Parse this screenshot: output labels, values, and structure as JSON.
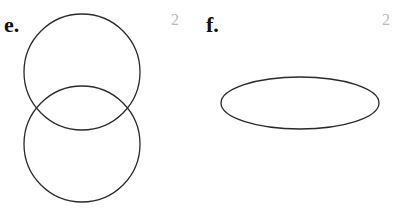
{
  "problems": [
    {
      "label": "e.",
      "marks": "2",
      "shapes": [
        {
          "type": "circle",
          "cx": 82,
          "cy": 72,
          "r": 58
        },
        {
          "type": "circle",
          "cx": 82,
          "cy": 144,
          "r": 58
        }
      ]
    },
    {
      "label": "f.",
      "marks": "2",
      "shapes": [
        {
          "type": "ellipse",
          "cx": 300,
          "cy": 103,
          "rx": 79,
          "ry": 26
        }
      ]
    }
  ],
  "colors": {
    "stroke": "#2a2a2a",
    "label": "#111111",
    "marks": "#bbbbbb"
  }
}
